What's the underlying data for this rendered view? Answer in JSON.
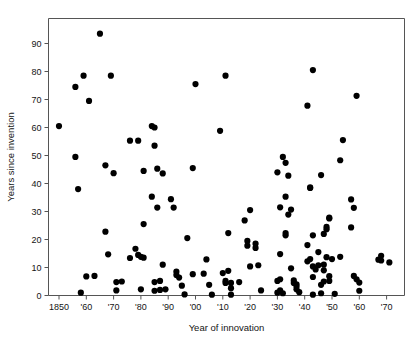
{
  "chart_data": {
    "type": "scatter",
    "title": "",
    "xlabel": "Year of innovation",
    "ylabel": "Years since invention",
    "xlim": [
      1846,
      1979
    ],
    "ylim": [
      0,
      97
    ],
    "grid": false,
    "legend": null,
    "x_tick_values": [
      1850,
      1860,
      1870,
      1880,
      1890,
      1900,
      1910,
      1920,
      1930,
      1940,
      1950,
      1960,
      1970
    ],
    "x_tick_labels": [
      "1850",
      "'60",
      "'70",
      "'80",
      "'90",
      "'00",
      "'10",
      "'20",
      "'30",
      "'40",
      "'50",
      "'60",
      "'70"
    ],
    "y_tick_values": [
      0,
      10,
      20,
      30,
      40,
      50,
      60,
      70,
      80,
      90
    ],
    "y_tick_labels": [
      "0",
      "10",
      "20",
      "30",
      "40",
      "50",
      "60",
      "70",
      "80",
      "90"
    ],
    "marker": "filled-circle",
    "marker_color": "#000000",
    "marker_size": 3.1,
    "points": [
      [
        1850,
        60.5
      ],
      [
        1856,
        74.5
      ],
      [
        1856,
        49.5
      ],
      [
        1857,
        38.0
      ],
      [
        1858,
        1.0
      ],
      [
        1859,
        78.5
      ],
      [
        1860,
        6.8
      ],
      [
        1861,
        69.5
      ],
      [
        1863,
        7.0
      ],
      [
        1865,
        93.5
      ],
      [
        1867,
        46.5
      ],
      [
        1867,
        22.8
      ],
      [
        1868,
        14.7
      ],
      [
        1869,
        78.5
      ],
      [
        1870,
        43.7
      ],
      [
        1871,
        4.8
      ],
      [
        1871,
        1.8
      ],
      [
        1873,
        5.0
      ],
      [
        1876,
        55.3
      ],
      [
        1876,
        13.4
      ],
      [
        1878,
        16.7
      ],
      [
        1879,
        55.3
      ],
      [
        1879,
        14.5
      ],
      [
        1880,
        2.2
      ],
      [
        1880,
        13.8
      ],
      [
        1881,
        44.5
      ],
      [
        1881,
        25.5
      ],
      [
        1881,
        13.5
      ],
      [
        1884,
        60.5
      ],
      [
        1884,
        35.3
      ],
      [
        1885,
        60.0
      ],
      [
        1885,
        53.5
      ],
      [
        1885,
        4.8
      ],
      [
        1885,
        1.7
      ],
      [
        1886,
        45.3
      ],
      [
        1886,
        31.4
      ],
      [
        1887,
        5.2
      ],
      [
        1887,
        2.0
      ],
      [
        1888,
        43.6
      ],
      [
        1888,
        11.0
      ],
      [
        1889,
        2.2
      ],
      [
        1891,
        34.4
      ],
      [
        1892,
        31.4
      ],
      [
        1893,
        8.5
      ],
      [
        1893,
        7.3
      ],
      [
        1894,
        6.4
      ],
      [
        1895,
        3.5
      ],
      [
        1896,
        0.4
      ],
      [
        1897,
        20.5
      ],
      [
        1899,
        45.5
      ],
      [
        1899,
        7.6
      ],
      [
        1900,
        75.5
      ],
      [
        1903,
        7.8
      ],
      [
        1904,
        12.9
      ],
      [
        1905,
        3.8
      ],
      [
        1906,
        0.3
      ],
      [
        1909,
        58.8
      ],
      [
        1910,
        8.0
      ],
      [
        1911,
        78.5
      ],
      [
        1911,
        5.2
      ],
      [
        1911,
        4.5
      ],
      [
        1912,
        22.3
      ],
      [
        1912,
        8.8
      ],
      [
        1913,
        4.5
      ],
      [
        1913,
        0.3
      ],
      [
        1913,
        2.6
      ],
      [
        1916,
        4.8
      ],
      [
        1918,
        26.8
      ],
      [
        1919,
        19.5
      ],
      [
        1919,
        17.8
      ],
      [
        1920,
        30.5
      ],
      [
        1920,
        10.4
      ],
      [
        1922,
        18.5
      ],
      [
        1922,
        17.0
      ],
      [
        1923,
        10.8
      ],
      [
        1924,
        1.8
      ],
      [
        1930,
        44.0
      ],
      [
        1930,
        5.2
      ],
      [
        1930,
        1.0
      ],
      [
        1931,
        31.5
      ],
      [
        1931,
        14.8
      ],
      [
        1931,
        5.8
      ],
      [
        1931,
        1.8
      ],
      [
        1932,
        49.5
      ],
      [
        1932,
        0.8
      ],
      [
        1933,
        47.4
      ],
      [
        1933,
        35.3
      ],
      [
        1933,
        22.3
      ],
      [
        1933,
        21.5
      ],
      [
        1934,
        42.8
      ],
      [
        1934,
        28.9
      ],
      [
        1935,
        30.7
      ],
      [
        1935,
        9.7
      ],
      [
        1936,
        5.4
      ],
      [
        1936,
        4.5
      ],
      [
        1937,
        4.0
      ],
      [
        1937,
        3.2
      ],
      [
        1937,
        2.2
      ],
      [
        1938,
        1.2
      ],
      [
        1941,
        67.8
      ],
      [
        1941,
        18.0
      ],
      [
        1941,
        12.2
      ],
      [
        1942,
        38.6
      ],
      [
        1942,
        38.4
      ],
      [
        1942,
        13.0
      ],
      [
        1943,
        80.5
      ],
      [
        1943,
        21.5
      ],
      [
        1943,
        10.4
      ],
      [
        1943,
        6.6
      ],
      [
        1943,
        0.3
      ],
      [
        1944,
        9.3
      ],
      [
        1945,
        15.5
      ],
      [
        1945,
        10.8
      ],
      [
        1946,
        43.0
      ],
      [
        1946,
        3.8
      ],
      [
        1946,
        0.8
      ],
      [
        1947,
        22.0
      ],
      [
        1947,
        11.0
      ],
      [
        1947,
        9.0
      ],
      [
        1947,
        5.0
      ],
      [
        1948,
        24.5
      ],
      [
        1948,
        23.7
      ],
      [
        1948,
        13.7
      ],
      [
        1949,
        27.8
      ],
      [
        1949,
        27.5
      ],
      [
        1949,
        6.9
      ],
      [
        1949,
        5.2
      ],
      [
        1950,
        13.0
      ],
      [
        1951,
        0.6
      ],
      [
        1953,
        48.3
      ],
      [
        1953,
        13.8
      ],
      [
        1954,
        55.5
      ],
      [
        1957,
        34.3
      ],
      [
        1957,
        24.3
      ],
      [
        1958,
        31.3
      ],
      [
        1958,
        7.0
      ],
      [
        1959,
        71.3
      ],
      [
        1959,
        5.8
      ],
      [
        1960,
        4.6
      ],
      [
        1960,
        1.7
      ],
      [
        1967,
        12.8
      ],
      [
        1968,
        14.2
      ],
      [
        1968,
        12.5
      ],
      [
        1971,
        11.8
      ]
    ]
  }
}
